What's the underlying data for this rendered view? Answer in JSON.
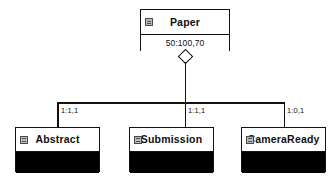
{
  "diagram": {
    "type": "uml-class-aggregation",
    "parent": {
      "name": "Paper",
      "attributes": "50:100,70",
      "icon": "class-icon"
    },
    "relationship": {
      "kind": "aggregation",
      "marker": "open-diamond"
    },
    "children": [
      {
        "name": "Abstract",
        "multiplicity": "1:1,1",
        "icon": "class-icon"
      },
      {
        "name": "Submission",
        "multiplicity": "1:1,1",
        "icon": "class-icon"
      },
      {
        "name": "CameraReady",
        "multiplicity": "1:0,1",
        "icon": "class-icon"
      }
    ]
  },
  "colors": {
    "line": "#111111",
    "box_fill": "#ffffff",
    "filled_compartment": "#000000",
    "icon_fill": "#b7b7b7"
  }
}
